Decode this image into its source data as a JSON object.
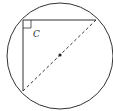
{
  "diagram": {
    "circle": {
      "cx": 60,
      "cy": 56,
      "r": 53
    },
    "vertices": {
      "C": {
        "x": 23,
        "y": 20
      },
      "A": {
        "x": 96,
        "y": 20
      },
      "B": {
        "x": 23,
        "y": 91
      }
    },
    "center_dot": {
      "x": 61,
      "y": 55
    },
    "right_angle_label": "C",
    "stroke_color": "#333333"
  }
}
